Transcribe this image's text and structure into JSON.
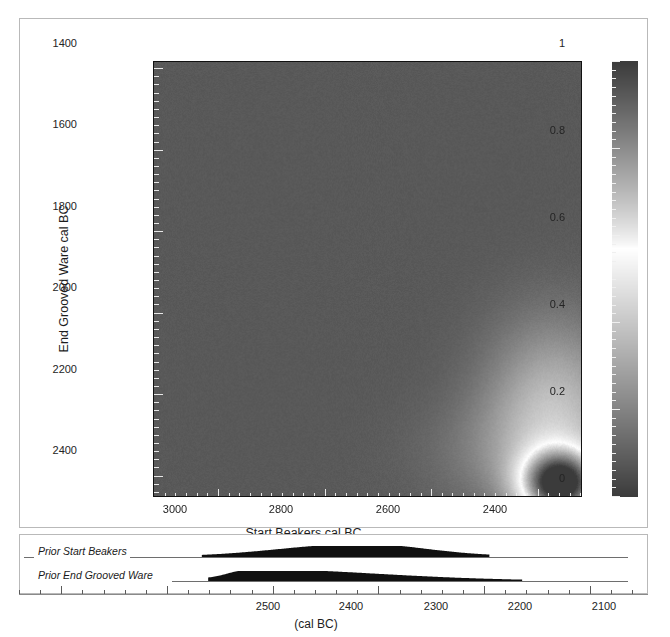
{
  "chart_data": {
    "type": "heatmap",
    "title": "",
    "xlabel": "Start Beakers cal BC",
    "ylabel": "End Grooved Ware cal BC",
    "x_axis": {
      "tick_labels": [
        "3000",
        "2800",
        "2600",
        "2400"
      ],
      "tick_values": [
        3000,
        2800,
        2600,
        2400
      ],
      "range": [
        3120,
        2315
      ],
      "direction": "decreasing",
      "minor_tick_step": 20
    },
    "y_axis": {
      "tick_labels": [
        "1400",
        "1600",
        "1800",
        "2000",
        "2200",
        "2400"
      ],
      "tick_values": [
        1400,
        1600,
        1800,
        2000,
        2200,
        2400
      ],
      "range": [
        1385,
        2455
      ],
      "direction": "increasing-downward",
      "minor_tick_step": 20
    },
    "colorbar": {
      "tick_labels": [
        "1",
        "0.8",
        "0.6",
        "0.4",
        "0.2",
        "0"
      ],
      "tick_values": [
        1,
        0.8,
        0.6,
        0.4,
        0.2,
        0
      ],
      "range": [
        0,
        1
      ],
      "position": "right",
      "scale_note": "greyscale: dark at 0, bright/white near 0.55-0.6, dark again toward 1"
    },
    "density_peak": {
      "x": 2355,
      "y": 2425,
      "description": "single bright probability mode near Start Beakers 2355 cal BC / End Grooved Ware 2425 cal BC with a diffuse plume extending upward"
    },
    "background_level": 0.08,
    "grid": false,
    "legend": false
  },
  "priors_panel": {
    "axis_title": "(cal BC)",
    "axis": {
      "tick_labels": [
        "2500",
        "2400",
        "2300",
        "2200",
        "2100"
      ],
      "tick_values": [
        2500,
        2400,
        2300,
        2200,
        2100
      ],
      "range": [
        2640,
        2045
      ],
      "direction": "decreasing",
      "minor_tick_step": 20
    },
    "distributions": [
      {
        "name": "Prior Start Beakers",
        "label": "Prior Start Beakers",
        "start": 2468,
        "end": 2196,
        "mode": 2318,
        "type": "probability-density"
      },
      {
        "name": "Prior End Grooved Ware",
        "label": "Prior End Grooved Ware",
        "start": 2462,
        "end": 2165,
        "mode": 2425,
        "type": "probability-density"
      }
    ]
  },
  "colors": {
    "frame": "#b9b9b9",
    "plot_border": "#111111",
    "heat_background": "#3b3b3b",
    "tick": "#e8e8e8",
    "text": "#242424",
    "density_fill": "#101010",
    "baseline": "#6e6e6e"
  }
}
